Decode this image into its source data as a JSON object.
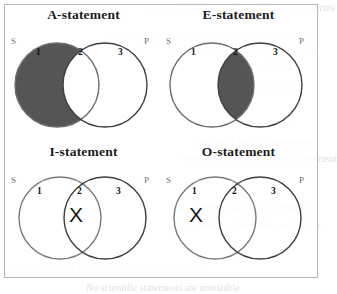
{
  "figure": {
    "panels": [
      {
        "id": "a",
        "title": "A-statement",
        "left_set_label": "S",
        "right_set_label": "P",
        "region_labels": [
          "1",
          "2",
          "3"
        ],
        "shaded_region": "1",
        "x_region": null,
        "x_mark": ""
      },
      {
        "id": "e",
        "title": "E-statement",
        "left_set_label": "S",
        "right_set_label": "P",
        "region_labels": [
          "1",
          "2",
          "3"
        ],
        "shaded_region": "2",
        "x_region": null,
        "x_mark": ""
      },
      {
        "id": "i",
        "title": "I-statement",
        "left_set_label": "S",
        "right_set_label": "P",
        "region_labels": [
          "1",
          "2",
          "3"
        ],
        "shaded_region": null,
        "x_region": "2",
        "x_mark": "X"
      },
      {
        "id": "o",
        "title": "O-statement",
        "left_set_label": "S",
        "right_set_label": "P",
        "region_labels": [
          "1",
          "2",
          "3"
        ],
        "shaded_region": null,
        "x_region": "1",
        "x_mark": "X"
      }
    ],
    "colors": {
      "shading": "#555555",
      "circle_stroke": "#4a4a4a",
      "circle_stroke_light": "#8b8b8b",
      "frame_border": "#b6b6b6",
      "label_gray": "#6f6f6f",
      "text_black": "#141414"
    }
  },
  "background_text": {
    "lines": [
      "to the contrary, they are relating the two terms",
      "the two propositions that contradict one another",
      "the contradictory of the proposition",
      "as the universal",
      "denying in both",
      "A and E statements",
      "and the I and O statements",
      "Venn Diagrams for Each Statement",
      "Venn Diagram Examples",
      "All scientific statements are testable",
      "statements that are not testable are not scientific",
      "No scientific statements are untestable"
    ]
  }
}
